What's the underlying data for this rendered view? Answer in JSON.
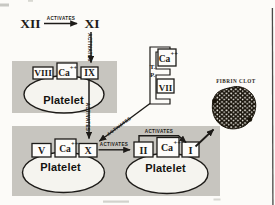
{
  "palette": {
    "ink": "#1d1b18",
    "panel_gray": "#c7c5bf",
    "paper": "#fcfbf8",
    "clot_dark": "#171209",
    "tab_white": "#fdfcfa"
  },
  "labels": {
    "activates": "ACTIVATES",
    "platelet": "Platelet",
    "calcium": "Ca",
    "calcium_sup": "++",
    "fibrin_clot": "FIBRIN CLOT",
    "tissue_factor_t": "T.",
    "tissue_factor_p": "P."
  },
  "factors": {
    "xii": "XII",
    "xi": "XI",
    "ix": "IX",
    "viii": "VIII",
    "vii": "VII",
    "x": "X",
    "v": "V",
    "ii": "II",
    "i": "I"
  }
}
